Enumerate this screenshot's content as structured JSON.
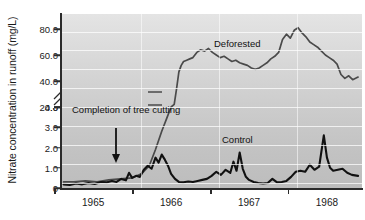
{
  "chart_data": {
    "type": "line",
    "title": "",
    "xlabel": "",
    "ylabel": "Nitrate concentration in runoff (mg/L)",
    "grid": true,
    "legend_position": "inline-annotations",
    "axis_break": {
      "present": true,
      "between": [
        4.0,
        20.0
      ],
      "symbol": "double-slash"
    },
    "yticks": [
      "0",
      "1.0",
      "2.0",
      "3.0",
      "4.0",
      "20.0",
      "40.0",
      "60.0",
      "80.0"
    ],
    "ytick_values": [
      0,
      1.0,
      2.0,
      3.0,
      4.0,
      20.0,
      40.0,
      60.0,
      80.0
    ],
    "ylim_lower_segment": [
      0,
      4.0
    ],
    "ylim_upper_segment": [
      20.0,
      90.0
    ],
    "xticks": [
      "1965",
      "1966",
      "1967",
      "1968"
    ],
    "xtick_values": [
      1965,
      1966,
      1967,
      1968
    ],
    "xlim": [
      1964.6,
      1968.45
    ],
    "annotations": [
      {
        "text": "Completion of tree cutting",
        "x": 1965.45,
        "y": 3.2,
        "arrow": "down"
      },
      {
        "text": "Deforested",
        "x": 1966.5,
        "y": 62
      },
      {
        "text": "Control",
        "x": 1966.6,
        "y": 1.5
      }
    ],
    "series": [
      {
        "name": "Deforested",
        "color": "#4a4a4a",
        "x": [
          1964.62,
          1964.75,
          1964.9,
          1965.05,
          1965.2,
          1965.35,
          1965.5,
          1965.62,
          1965.72,
          1965.8,
          1965.88,
          1965.95,
          1966.0,
          1966.04,
          1966.07,
          1966.1,
          1966.13,
          1966.16,
          1966.2,
          1966.24,
          1966.28,
          1966.33,
          1966.38,
          1966.43,
          1966.48,
          1966.53,
          1966.58,
          1966.63,
          1966.68,
          1966.73,
          1966.78,
          1966.83,
          1966.88,
          1966.93,
          1966.98,
          1967.03,
          1967.08,
          1967.13,
          1967.18,
          1967.23,
          1967.28,
          1967.33,
          1967.38,
          1967.43,
          1967.48,
          1967.53,
          1967.58,
          1967.63,
          1967.68,
          1967.73,
          1967.78,
          1967.83,
          1967.88,
          1967.93,
          1967.98,
          1968.03,
          1968.08,
          1968.13,
          1968.18,
          1968.23,
          1968.28,
          1968.33,
          1968.4
        ],
        "y": [
          0.3,
          0.3,
          0.35,
          0.3,
          0.4,
          0.45,
          0.5,
          0.7,
          1.1,
          1.9,
          2.8,
          3.5,
          4.0,
          22,
          34,
          47,
          52,
          55,
          56,
          57,
          58,
          62,
          64,
          63,
          65,
          62,
          60,
          58,
          59,
          57,
          55,
          56,
          54,
          53,
          52,
          50,
          49,
          50,
          52,
          54,
          57,
          59,
          62,
          72,
          76,
          73,
          79,
          81,
          77,
          74,
          70,
          68,
          66,
          63,
          60,
          58,
          56,
          53,
          45,
          42,
          44,
          41,
          43
        ]
      },
      {
        "name": "Control",
        "color": "#111111",
        "x": [
          1964.62,
          1964.7,
          1964.78,
          1964.86,
          1964.94,
          1965.02,
          1965.1,
          1965.18,
          1965.24,
          1965.3,
          1965.36,
          1965.42,
          1965.46,
          1965.5,
          1965.55,
          1965.6,
          1965.65,
          1965.7,
          1965.75,
          1965.8,
          1965.84,
          1965.88,
          1965.92,
          1965.96,
          1966.0,
          1966.05,
          1966.1,
          1966.16,
          1966.22,
          1966.28,
          1966.34,
          1966.4,
          1966.46,
          1966.52,
          1966.58,
          1966.64,
          1966.7,
          1966.76,
          1966.8,
          1966.84,
          1966.88,
          1966.92,
          1966.96,
          1967.0,
          1967.06,
          1967.12,
          1967.18,
          1967.24,
          1967.3,
          1967.36,
          1967.42,
          1967.48,
          1967.54,
          1967.6,
          1967.66,
          1967.72,
          1967.78,
          1967.84,
          1967.9,
          1967.96,
          1968.0,
          1968.04,
          1968.08,
          1968.14,
          1968.2,
          1968.26,
          1968.32,
          1968.4
        ],
        "y": [
          0.18,
          0.15,
          0.22,
          0.18,
          0.25,
          0.2,
          0.3,
          0.28,
          0.35,
          0.3,
          0.45,
          0.38,
          0.75,
          0.5,
          0.6,
          0.55,
          0.9,
          1.1,
          0.95,
          1.5,
          1.25,
          1.65,
          1.4,
          1.1,
          0.7,
          0.45,
          0.3,
          0.28,
          0.32,
          0.3,
          0.35,
          0.4,
          0.45,
          0.6,
          0.8,
          0.65,
          0.9,
          0.75,
          1.3,
          0.85,
          1.75,
          0.95,
          0.55,
          0.4,
          0.3,
          0.25,
          0.22,
          0.25,
          0.45,
          0.28,
          0.3,
          0.35,
          0.55,
          0.8,
          0.85,
          0.8,
          1.15,
          0.9,
          1.05,
          2.6,
          1.5,
          1.0,
          0.85,
          0.9,
          0.95,
          0.75,
          0.65,
          0.6
        ]
      }
    ]
  }
}
